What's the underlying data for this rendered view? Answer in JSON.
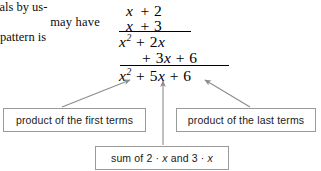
{
  "figure": {
    "background": "#ffffff",
    "arrow_color": "#8c8c8c",
    "box_border_color": "#9a9a9a",
    "text_color": "#000000"
  },
  "prose": {
    "lines": [
      "ials by us-",
      "may have",
      "pattern   is"
    ]
  },
  "work": {
    "multiplicand": {
      "term1": "x",
      "op": "+",
      "term2": "2"
    },
    "multiplier": {
      "term1": "x",
      "op": "+",
      "term2": "3"
    },
    "partial_1": {
      "sq_base": "x",
      "sq_exp": "2",
      "op": "+",
      "term": "2",
      "var": "x"
    },
    "partial_2": {
      "op1": "+",
      "coef": "3",
      "var": "x",
      "op2": "+",
      "const": "6"
    },
    "product": {
      "sq_base": "x",
      "sq_exp": "2",
      "op1": "+",
      "coef": "5",
      "var": "x",
      "op2": "+",
      "const": "6"
    }
  },
  "callouts": {
    "first_terms": "product of the first terms",
    "last_terms": "product of the last terms",
    "sum": {
      "prefix": "sum of 2",
      "dot1": "·",
      "var1": "x",
      "middle": "and 3",
      "dot2": "·",
      "var2": "x"
    }
  },
  "arrows": [
    {
      "name": "arrow-first-terms",
      "from": [
        62,
        107
      ],
      "to": [
        130,
        80
      ]
    },
    {
      "name": "arrow-sum",
      "from": [
        163,
        145
      ],
      "to": [
        163,
        81
      ]
    },
    {
      "name": "arrow-last-terms",
      "from": [
        250,
        107
      ],
      "to": [
        205,
        80
      ]
    }
  ]
}
